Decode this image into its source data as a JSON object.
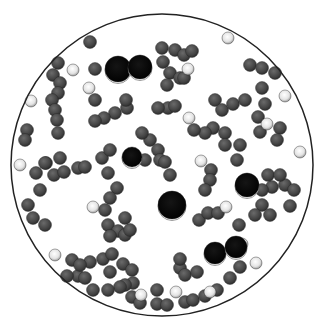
{
  "image": {
    "description": "Particle simulation rendering inside a circular boundary",
    "width": 315,
    "height": 325,
    "boundary": {
      "cx": 162,
      "cy": 165,
      "r": 151,
      "stroke": "#222222"
    },
    "colors": {
      "gray_particle": "#4a4a4a",
      "white_particle": "#e8e8e8",
      "black_particle": "#0a0a0a",
      "background": "#ffffff"
    },
    "large_black_particles": [
      {
        "x": 118,
        "y": 69,
        "r": 13
      },
      {
        "x": 140,
        "y": 67,
        "r": 12
      },
      {
        "x": 132,
        "y": 157,
        "r": 10
      },
      {
        "x": 172,
        "y": 205,
        "r": 14
      },
      {
        "x": 247,
        "y": 185,
        "r": 12
      },
      {
        "x": 215,
        "y": 253,
        "r": 11
      },
      {
        "x": 236,
        "y": 247,
        "r": 11
      }
    ],
    "white_particles": [
      [
        150,
        18
      ],
      [
        73,
        70
      ],
      [
        89,
        88
      ],
      [
        31,
        101
      ],
      [
        188,
        69
      ],
      [
        228,
        38
      ],
      [
        285,
        96
      ],
      [
        189,
        118
      ],
      [
        267,
        124
      ],
      [
        20,
        165
      ],
      [
        93,
        207
      ],
      [
        300,
        152
      ],
      [
        226,
        207
      ],
      [
        201,
        161
      ],
      [
        242,
        244
      ],
      [
        256,
        263
      ],
      [
        55,
        255
      ],
      [
        141,
        295
      ],
      [
        107,
        302
      ],
      [
        176,
        292
      ],
      [
        210,
        292
      ],
      [
        300,
        270
      ]
    ],
    "gray_particles": [
      [
        90,
        42
      ],
      [
        58,
        63
      ],
      [
        53,
        75
      ],
      [
        60,
        83
      ],
      [
        58,
        93
      ],
      [
        52,
        100
      ],
      [
        55,
        110
      ],
      [
        57,
        120
      ],
      [
        58,
        133
      ],
      [
        27,
        130
      ],
      [
        25,
        140
      ],
      [
        95,
        100
      ],
      [
        95,
        69
      ],
      [
        127,
        108
      ],
      [
        115,
        113
      ],
      [
        104,
        118
      ],
      [
        95,
        121
      ],
      [
        126,
        100
      ],
      [
        162,
        48
      ],
      [
        175,
        50
      ],
      [
        163,
        62
      ],
      [
        170,
        73
      ],
      [
        167,
        85
      ],
      [
        184,
        55
      ],
      [
        192,
        51
      ],
      [
        180,
        78
      ],
      [
        168,
        108
      ],
      [
        175,
        106
      ],
      [
        158,
        108
      ],
      [
        215,
        100
      ],
      [
        222,
        110
      ],
      [
        233,
        104
      ],
      [
        250,
        65
      ],
      [
        262,
        68
      ],
      [
        275,
        73
      ],
      [
        286,
        78
      ],
      [
        245,
        100
      ],
      [
        262,
        88
      ],
      [
        265,
        104
      ],
      [
        258,
        117
      ],
      [
        260,
        132
      ],
      [
        240,
        145
      ],
      [
        225,
        133
      ],
      [
        213,
        128
      ],
      [
        205,
        133
      ],
      [
        194,
        130
      ],
      [
        280,
        128
      ],
      [
        277,
        140
      ],
      [
        237,
        160
      ],
      [
        285,
        185
      ],
      [
        272,
        187
      ],
      [
        262,
        190
      ],
      [
        268,
        175
      ],
      [
        280,
        175
      ],
      [
        150,
        140
      ],
      [
        142,
        133
      ],
      [
        158,
        150
      ],
      [
        160,
        160
      ],
      [
        165,
        162
      ],
      [
        145,
        160
      ],
      [
        170,
        175
      ],
      [
        184,
        78
      ],
      [
        211,
        170
      ],
      [
        210,
        180
      ],
      [
        205,
        190
      ],
      [
        199,
        220
      ],
      [
        208,
        213
      ],
      [
        218,
        213
      ],
      [
        180,
        268
      ],
      [
        185,
        275
      ],
      [
        180,
        259
      ],
      [
        239,
        225
      ],
      [
        262,
        205
      ],
      [
        290,
        206
      ],
      [
        294,
        190
      ],
      [
        270,
        215
      ],
      [
        255,
        215
      ],
      [
        28,
        205
      ],
      [
        33,
        218
      ],
      [
        45,
        225
      ],
      [
        40,
        190
      ],
      [
        36,
        173
      ],
      [
        46,
        163
      ],
      [
        60,
        158
      ],
      [
        54,
        175
      ],
      [
        64,
        172
      ],
      [
        78,
        168
      ],
      [
        85,
        167
      ],
      [
        102,
        158
      ],
      [
        110,
        150
      ],
      [
        108,
        173
      ],
      [
        117,
        188
      ],
      [
        110,
        198
      ],
      [
        105,
        210
      ],
      [
        108,
        225
      ],
      [
        118,
        231
      ],
      [
        125,
        235
      ],
      [
        130,
        230
      ],
      [
        125,
        218
      ],
      [
        110,
        236
      ],
      [
        78,
        276
      ],
      [
        90,
        262
      ],
      [
        103,
        259
      ],
      [
        112,
        254
      ],
      [
        123,
        264
      ],
      [
        132,
        270
      ],
      [
        133,
        283
      ],
      [
        125,
        285
      ],
      [
        120,
        287
      ],
      [
        93,
        290
      ],
      [
        108,
        290
      ],
      [
        67,
        276
      ],
      [
        85,
        278
      ],
      [
        45,
        163
      ],
      [
        72,
        260
      ],
      [
        80,
        265
      ],
      [
        110,
        272
      ],
      [
        132,
        297
      ],
      [
        140,
        303
      ],
      [
        157,
        304
      ],
      [
        157,
        290
      ],
      [
        167,
        305
      ],
      [
        185,
        302
      ],
      [
        193,
        300
      ],
      [
        205,
        296
      ],
      [
        217,
        290
      ],
      [
        230,
        278
      ],
      [
        240,
        267
      ],
      [
        197,
        272
      ],
      [
        225,
        145
      ]
    ]
  }
}
